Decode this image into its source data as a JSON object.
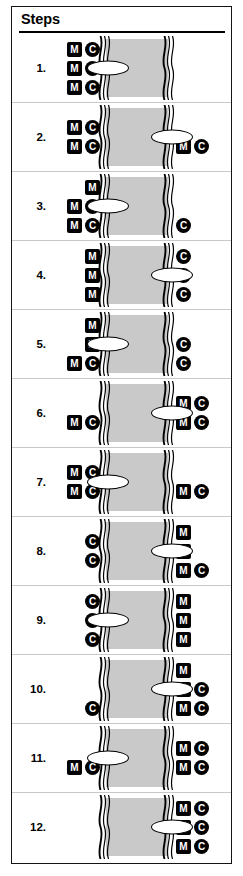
{
  "panel": {
    "header_title": "Steps",
    "accent_color": "#000000",
    "river_color": "#c9c9c9",
    "token_color": "#000000",
    "boat_fill": "#ffffff"
  },
  "legend": {
    "missionary_label": "M",
    "cannibal_label": "C",
    "boat_name": "boat"
  },
  "steps": [
    {
      "number": "1.",
      "boat_side": "left",
      "left": {
        "missionaries": 3,
        "cannibals": 3
      },
      "right": {
        "missionaries": 0,
        "cannibals": 0
      },
      "rows_left": [
        [
          "M",
          "C"
        ],
        [
          "M",
          "C"
        ],
        [
          "M",
          "C"
        ]
      ],
      "rows_right": [
        [],
        [],
        []
      ]
    },
    {
      "number": "2.",
      "boat_side": "right",
      "left": {
        "missionaries": 2,
        "cannibals": 2
      },
      "right": {
        "missionaries": 1,
        "cannibals": 1
      },
      "rows_left": [
        [
          "M",
          "C"
        ],
        [
          "M",
          "C"
        ]
      ],
      "rows_right": [
        [],
        [
          "M",
          "C"
        ]
      ]
    },
    {
      "number": "3.",
      "boat_side": "left",
      "left": {
        "missionaries": 3,
        "cannibals": 2
      },
      "right": {
        "missionaries": 0,
        "cannibals": 1
      },
      "rows_left": [
        [
          "M"
        ],
        [
          "M",
          "C"
        ],
        [
          "M",
          "C"
        ]
      ],
      "rows_right": [
        [],
        [],
        [
          "C"
        ]
      ]
    },
    {
      "number": "4.",
      "boat_side": "right",
      "left": {
        "missionaries": 3,
        "cannibals": 0
      },
      "right": {
        "missionaries": 0,
        "cannibals": 3
      },
      "rows_left": [
        [
          "M"
        ],
        [
          "M"
        ],
        [
          "M"
        ]
      ],
      "rows_right": [
        [
          "C"
        ],
        [
          "C"
        ],
        [
          "C"
        ]
      ]
    },
    {
      "number": "5.",
      "boat_side": "left",
      "left": {
        "missionaries": 3,
        "cannibals": 1
      },
      "right": {
        "missionaries": 0,
        "cannibals": 2
      },
      "rows_left": [
        [
          "M"
        ],
        [
          "M"
        ],
        [
          "M",
          "C"
        ]
      ],
      "rows_right": [
        [],
        [
          "C"
        ],
        [
          "C"
        ]
      ]
    },
    {
      "number": "6.",
      "boat_side": "right",
      "left": {
        "missionaries": 1,
        "cannibals": 1
      },
      "right": {
        "missionaries": 2,
        "cannibals": 2
      },
      "rows_left": [
        [],
        [
          "M",
          "C"
        ]
      ],
      "rows_right": [
        [
          "M",
          "C"
        ],
        [
          "M",
          "C"
        ]
      ]
    },
    {
      "number": "7.",
      "boat_side": "left",
      "left": {
        "missionaries": 2,
        "cannibals": 2
      },
      "right": {
        "missionaries": 1,
        "cannibals": 1
      },
      "rows_left": [
        [
          "M",
          "C"
        ],
        [
          "M",
          "C"
        ]
      ],
      "rows_right": [
        [],
        [
          "M",
          "C"
        ]
      ]
    },
    {
      "number": "8.",
      "boat_side": "right",
      "left": {
        "missionaries": 0,
        "cannibals": 2
      },
      "right": {
        "missionaries": 3,
        "cannibals": 1
      },
      "rows_left": [
        [
          "C"
        ],
        [
          "C"
        ]
      ],
      "rows_right": [
        [
          "M"
        ],
        [
          "M"
        ],
        [
          "M",
          "C"
        ]
      ]
    },
    {
      "number": "9.",
      "boat_side": "left",
      "left": {
        "missionaries": 0,
        "cannibals": 3
      },
      "right": {
        "missionaries": 3,
        "cannibals": 0
      },
      "rows_left": [
        [
          "C"
        ],
        [
          "C"
        ],
        [
          "C"
        ]
      ],
      "rows_right": [
        [
          "M"
        ],
        [
          "M"
        ],
        [
          "M"
        ]
      ]
    },
    {
      "number": "10.",
      "boat_side": "right",
      "left": {
        "missionaries": 0,
        "cannibals": 1
      },
      "right": {
        "missionaries": 3,
        "cannibals": 2
      },
      "rows_left": [
        [],
        [],
        [
          "C"
        ]
      ],
      "rows_right": [
        [
          "M"
        ],
        [
          "M",
          "C"
        ],
        [
          "M",
          "C"
        ]
      ]
    },
    {
      "number": "11.",
      "boat_side": "left",
      "left": {
        "missionaries": 1,
        "cannibals": 1
      },
      "right": {
        "missionaries": 2,
        "cannibals": 2
      },
      "rows_left": [
        [],
        [
          "M",
          "C"
        ]
      ],
      "rows_right": [
        [
          "M",
          "C"
        ],
        [
          "M",
          "C"
        ]
      ]
    },
    {
      "number": "12.",
      "boat_side": "right",
      "left": {
        "missionaries": 0,
        "cannibals": 0
      },
      "right": {
        "missionaries": 3,
        "cannibals": 3
      },
      "rows_left": [
        [],
        [],
        []
      ],
      "rows_right": [
        [
          "M",
          "C"
        ],
        [
          "M",
          "C"
        ],
        [
          "M",
          "C"
        ]
      ]
    }
  ]
}
